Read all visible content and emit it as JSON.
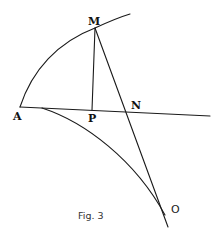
{
  "figure": {
    "caption": "Fig. 3",
    "points": {
      "A": {
        "label": "A",
        "x": 20,
        "y": 107
      },
      "M": {
        "label": "M",
        "x": 95,
        "y": 28
      },
      "P": {
        "label": "P",
        "x": 92,
        "y": 110
      },
      "N": {
        "label": "N",
        "x": 129,
        "y": 112
      },
      "O": {
        "label": "O",
        "x": 165,
        "y": 215
      }
    },
    "elements": [
      {
        "name": "upper-arc",
        "description": "Circular arc from A curving up through M"
      },
      {
        "name": "baseline-AN",
        "description": "Straight line from A through P and N extending right"
      },
      {
        "name": "segment-MP",
        "description": "Perpendicular segment from M down to P"
      },
      {
        "name": "line-MNO",
        "description": "Straight line from M through N down to O"
      },
      {
        "name": "lower-curve",
        "description": "Curve from near A descending to O"
      }
    ],
    "colors": {
      "stroke": "#1a1a1a",
      "background": "#ffffff"
    }
  }
}
